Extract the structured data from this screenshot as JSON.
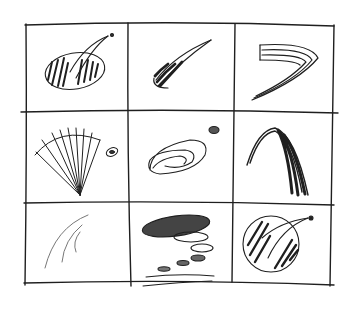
{
  "sketch": {
    "description": "Hand-drawn pencil sketch: 3x3 grid of comet/swoosh logo concepts",
    "background": "#ffffff",
    "ink": "#1a1a1a",
    "grid": {
      "rows": 3,
      "cols": 3
    },
    "cells": [
      {
        "row": 1,
        "col": 1,
        "concept": "hatched oval with comet swoosh and dot"
      },
      {
        "row": 1,
        "col": 2,
        "concept": "streaking comet stroke"
      },
      {
        "row": 1,
        "col": 3,
        "concept": "multi-line chevron swoosh"
      },
      {
        "row": 2,
        "col": 1,
        "concept": "radiating fan lines with small oval"
      },
      {
        "row": 2,
        "col": 2,
        "concept": "spiral galaxy with dot"
      },
      {
        "row": 2,
        "col": 3,
        "concept": "dark arching hair-like strokes"
      },
      {
        "row": 3,
        "col": 1,
        "concept": "light nested arcs"
      },
      {
        "row": 3,
        "col": 2,
        "concept": "descending ovals trail with speed lines"
      },
      {
        "row": 3,
        "col": 3,
        "concept": "hatched globe with swoosh and dot"
      }
    ]
  }
}
